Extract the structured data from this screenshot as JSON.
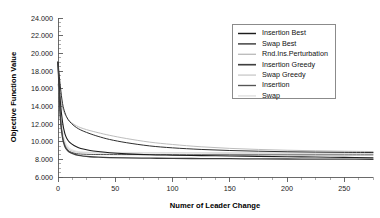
{
  "chart_data": {
    "type": "line",
    "title": "",
    "xlabel": "Numer of Leader Change",
    "ylabel": "Objective Function Value",
    "xlim": [
      0,
      275
    ],
    "ylim": [
      6000,
      24000
    ],
    "xticks": [
      0,
      50,
      100,
      150,
      200,
      250
    ],
    "xtick_labels": [
      "0",
      "50",
      "100",
      "150",
      "200",
      "250"
    ],
    "yticks": [
      6000,
      8000,
      10000,
      12000,
      14000,
      16000,
      18000,
      20000,
      22000,
      24000
    ],
    "ytick_labels": [
      "6.000",
      "8.000",
      "10.000",
      "12.000",
      "14.000",
      "16.000",
      "18.000",
      "20.000",
      "22.000",
      "24.000"
    ],
    "minor_ticks": true,
    "grid": false,
    "legend_position": "upper right",
    "frame": "left-bottom",
    "series": [
      {
        "name": "Insertion Best",
        "color": "#1c1c1c",
        "width": 1.1,
        "x": [
          0,
          2,
          4,
          6,
          8,
          10,
          14,
          18,
          22,
          28,
          35,
          45,
          60,
          80,
          100,
          125,
          150,
          175,
          200,
          225,
          250,
          275
        ],
        "values": [
          19000,
          14600,
          12200,
          10900,
          10300,
          9950,
          9560,
          9320,
          9160,
          9000,
          8880,
          8740,
          8620,
          8520,
          8470,
          8420,
          8380,
          8340,
          8300,
          8260,
          8220,
          8180
        ]
      },
      {
        "name": "Swap Best",
        "color": "#2e2e2e",
        "width": 1.0,
        "x": [
          0,
          2,
          4,
          6,
          8,
          10,
          14,
          18,
          22,
          28,
          35,
          45,
          60,
          80,
          100,
          125,
          150,
          175,
          200,
          225,
          250,
          275
        ],
        "values": [
          19000,
          16300,
          14300,
          13300,
          12700,
          12300,
          11800,
          11450,
          11200,
          10900,
          10600,
          10250,
          9880,
          9520,
          9300,
          9120,
          9000,
          8920,
          8860,
          8820,
          8790,
          8770
        ]
      },
      {
        "name": "Rnd.Ins.Perturbation",
        "color": "#bdbdbd",
        "width": 1.0,
        "x": [
          0,
          2,
          4,
          6,
          8,
          10,
          14,
          18,
          22,
          28,
          35,
          45,
          60,
          80,
          100,
          125,
          150,
          175,
          200,
          225,
          250,
          275
        ],
        "values": [
          16500,
          15000,
          13800,
          13100,
          12650,
          12350,
          11950,
          11680,
          11480,
          11250,
          11020,
          10720,
          10350,
          9950,
          9680,
          9420,
          9240,
          9120,
          9030,
          8970,
          8920,
          8880
        ]
      },
      {
        "name": "Insertion Greedy",
        "color": "#3f3f3f",
        "width": 1.3,
        "x": [
          0,
          2,
          4,
          6,
          8,
          10,
          14,
          18,
          22,
          28,
          35,
          45,
          60,
          80,
          100,
          125,
          150,
          175,
          200,
          225,
          250,
          275
        ],
        "values": [
          19000,
          12800,
          10400,
          9450,
          9050,
          8820,
          8580,
          8440,
          8360,
          8290,
          8240,
          8200,
          8160,
          8130,
          8110,
          8090,
          8070,
          8055,
          8040,
          8030,
          8020,
          8010
        ]
      },
      {
        "name": "Swap Greedy",
        "color": "#d2d2d2",
        "width": 1.2,
        "x": [
          0,
          2,
          4,
          6,
          8,
          10,
          14,
          18,
          22,
          28,
          35,
          45,
          60,
          80,
          100,
          125,
          150,
          175,
          200,
          225,
          250,
          275
        ],
        "values": [
          19000,
          13400,
          10900,
          9800,
          9320,
          9080,
          8880,
          8800,
          8770,
          8750,
          8740,
          8735,
          8730,
          8725,
          8720,
          8715,
          8712,
          8710,
          8708,
          8706,
          8705,
          8704
        ]
      },
      {
        "name": "Insertion",
        "color": "#555555",
        "width": 1.0,
        "x": [
          0,
          2,
          4,
          6,
          8,
          10,
          14,
          18,
          22,
          28,
          35,
          45,
          60,
          80,
          100,
          125,
          150,
          175,
          200,
          225,
          250,
          275
        ],
        "values": [
          19000,
          13100,
          10600,
          9600,
          9150,
          8900,
          8700,
          8620,
          8580,
          8555,
          8545,
          8540,
          8535,
          8530,
          8525,
          8520,
          8515,
          8512,
          8510,
          8508,
          8506,
          8505
        ]
      },
      {
        "name": "Swap",
        "color": "#e0e0e0",
        "width": 1.0,
        "x": [
          0,
          2,
          4,
          6,
          8,
          10,
          14,
          18,
          22,
          28,
          35,
          45,
          60,
          80,
          100,
          125,
          150,
          175,
          200,
          225,
          250,
          275
        ],
        "values": [
          19000,
          13900,
          11300,
          10100,
          9550,
          9250,
          8990,
          8880,
          8830,
          8800,
          8790,
          8785,
          8780,
          8776,
          8772,
          8768,
          8765,
          8762,
          8760,
          8758,
          8756,
          8755
        ]
      }
    ]
  },
  "legend": {
    "entries": [
      {
        "label": "Insertion Best"
      },
      {
        "label": "Swap Best"
      },
      {
        "label": "Rnd.Ins.Perturbation"
      },
      {
        "label": "Insertion Greedy"
      },
      {
        "label": "Swap Greedy"
      },
      {
        "label": "Insertion"
      },
      {
        "label": "Swap"
      }
    ]
  }
}
